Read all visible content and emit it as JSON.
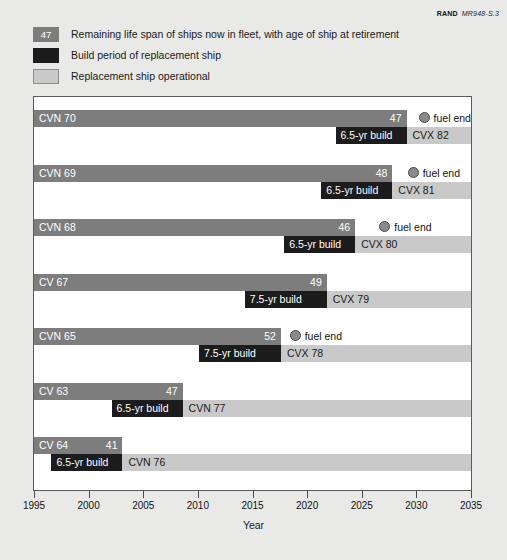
{
  "credit": {
    "org": "RAND",
    "number": "MR948-S.3"
  },
  "legend": {
    "items": [
      {
        "swatch": "life-span-swatch",
        "badge": "47",
        "label": "Remaining life span of ships now in fleet, with age of ship at retirement"
      },
      {
        "swatch": "build-period-swatch",
        "badge": "",
        "label": "Build period of replacement ship"
      },
      {
        "swatch": "replacement-operational-swatch",
        "badge": "",
        "label": "Replacement ship operational"
      }
    ]
  },
  "colors": {
    "life_span": "#7d7d7d",
    "build_period": "#1c1c1c",
    "operational": "#c9c9c9",
    "fuel_end_dot": "#8a8a8a",
    "background": "#e9e9e7",
    "plot_background": "#ffffff"
  },
  "axis": {
    "label": "Year",
    "ticks": [
      1995,
      2000,
      2005,
      2010,
      2015,
      2020,
      2025,
      2030,
      2035
    ],
    "min": 1995,
    "max": 2035
  },
  "fuel_end_text": "fuel end",
  "chart_data": {
    "type": "bar",
    "title": "",
    "subtitle": "",
    "xlabel": "Year",
    "ylabel": "",
    "xlim": [
      1995,
      2035
    ],
    "grid": false,
    "legend_position": "above-plot",
    "categories": [
      "CVN 70",
      "CVN 69",
      "CVN 68",
      "CV 67",
      "CVN 65",
      "CV 63",
      "CV 64"
    ],
    "series": [
      {
        "name": "Remaining life span of ships now in fleet, with age of ship at retirement",
        "color": "#7d7d7d"
      },
      {
        "name": "Build period of replacement ship",
        "color": "#1c1c1c"
      },
      {
        "name": "Replacement ship operational",
        "color": "#c9c9c9"
      }
    ],
    "rows": [
      {
        "ship": "CVN 70",
        "age_at_retirement": 47,
        "life_start": 1995,
        "life_end": 2029.1,
        "fuel_end_marker": true,
        "fuel_end_year": 2030.2,
        "fuel_end_label": "fuel end",
        "build_label": "6.5-yr build",
        "build_start": 2022.6,
        "build_end": 2029.1,
        "replacement": "CVX 82",
        "oper_start": 2029.1,
        "oper_end": 2035
      },
      {
        "ship": "CVN 69",
        "age_at_retirement": 48,
        "life_start": 1995,
        "life_end": 2027.8,
        "fuel_end_marker": true,
        "fuel_end_year": 2029.2,
        "fuel_end_label": "fuel end",
        "build_label": "6.5-yr build",
        "build_start": 2021.3,
        "build_end": 2027.8,
        "replacement": "CVX 81",
        "oper_start": 2027.8,
        "oper_end": 2035
      },
      {
        "ship": "CVN 68",
        "age_at_retirement": 46,
        "life_start": 1995,
        "life_end": 2024.4,
        "fuel_end_marker": true,
        "fuel_end_year": 2026.6,
        "fuel_end_label": "fuel end",
        "build_label": "6.5-yr build",
        "build_start": 2017.9,
        "build_end": 2024.4,
        "replacement": "CVX 80",
        "oper_start": 2024.4,
        "oper_end": 2035
      },
      {
        "ship": "CV 67",
        "age_at_retirement": 49,
        "life_start": 1995,
        "life_end": 2021.8,
        "fuel_end_marker": false,
        "fuel_end_year": null,
        "fuel_end_label": "",
        "build_label": "7.5-yr build",
        "build_start": 2014.3,
        "build_end": 2021.8,
        "replacement": "CVX 79",
        "oper_start": 2021.8,
        "oper_end": 2035
      },
      {
        "ship": "CVN 65",
        "age_at_retirement": 52,
        "life_start": 1995,
        "life_end": 2017.6,
        "fuel_end_marker": true,
        "fuel_end_year": 2018.4,
        "fuel_end_label": "fuel end",
        "build_label": "7.5-yr build",
        "build_start": 2010.1,
        "build_end": 2017.6,
        "replacement": "CVX 78",
        "oper_start": 2017.6,
        "oper_end": 2035
      },
      {
        "ship": "CV 63",
        "age_at_retirement": 47,
        "life_start": 1995,
        "life_end": 2008.6,
        "fuel_end_marker": false,
        "fuel_end_year": null,
        "fuel_end_label": "",
        "build_label": "6.5-yr build",
        "build_start": 2002.1,
        "build_end": 2008.6,
        "replacement": "CVN 77",
        "oper_start": 2008.6,
        "oper_end": 2035
      },
      {
        "ship": "CV 64",
        "age_at_retirement": 41,
        "life_start": 1995,
        "life_end": 2003.1,
        "fuel_end_marker": false,
        "fuel_end_year": null,
        "fuel_end_label": "",
        "build_label": "6.5-yr build",
        "build_start": 1996.6,
        "build_end": 2003.1,
        "replacement": "CVN 76",
        "oper_start": 2003.1,
        "oper_end": 2035
      }
    ]
  }
}
